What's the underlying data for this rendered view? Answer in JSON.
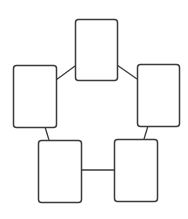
{
  "diagram": {
    "type": "cycle",
    "background": "#ffffff",
    "stroke_color": "#3a3a3a",
    "node_fill": "#ffffff",
    "corner_radius": 3,
    "nodes": [
      {
        "id": "top",
        "label": "",
        "x": 75,
        "y": 19,
        "width": 42,
        "height": 61
      },
      {
        "id": "left",
        "label": "",
        "x": 13,
        "y": 65,
        "width": 43,
        "height": 62
      },
      {
        "id": "right",
        "label": "",
        "x": 137,
        "y": 64,
        "width": 42,
        "height": 62
      },
      {
        "id": "bottom-left",
        "label": "",
        "x": 38,
        "y": 140,
        "width": 43,
        "height": 62
      },
      {
        "id": "bottom-right",
        "label": "",
        "x": 114,
        "y": 139,
        "width": 43,
        "height": 62
      }
    ],
    "edges": [
      {
        "from": "top",
        "to": "left",
        "x1": 75,
        "y1": 66,
        "x2": 56,
        "y2": 80
      },
      {
        "from": "top",
        "to": "right",
        "x1": 117,
        "y1": 65,
        "x2": 137,
        "y2": 79
      },
      {
        "from": "left",
        "to": "bottom-left",
        "x1": 45,
        "y1": 127,
        "x2": 49,
        "y2": 140
      },
      {
        "from": "right",
        "to": "bottom-right",
        "x1": 148,
        "y1": 126,
        "x2": 144,
        "y2": 139
      },
      {
        "from": "bottom-left",
        "to": "bottom-right",
        "x1": 81,
        "y1": 170,
        "x2": 114,
        "y2": 170
      }
    ]
  }
}
